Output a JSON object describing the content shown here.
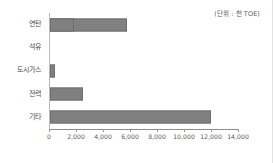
{
  "chart_data": {
    "type": "bar",
    "orientation": "horizontal",
    "title": "",
    "subtitle": "",
    "unit_note": "(단위 : 천 TOE)",
    "categories": [
      "연탄",
      "석유",
      "도시가스",
      "전력",
      "기타"
    ],
    "values": [
      400,
      2440,
      11900,
      5700,
      1780
    ],
    "series": [
      {
        "name": "",
        "values": [
          400,
          2440,
          11900,
          5700,
          1780
        ]
      }
    ],
    "xlabel": "",
    "ylabel": "",
    "xlim": [
      0,
      14000
    ],
    "xticks": [
      0,
      2000,
      4000,
      6000,
      8000,
      10000,
      12000,
      14000
    ],
    "xtick_labels": [
      "0",
      "2,000",
      "4,000",
      "6,000",
      "8,000",
      "10,000",
      "12,000",
      "14,000"
    ],
    "grid": false,
    "legend": false,
    "bar_color": "#808080",
    "bar_border_color": "#6f6f6f",
    "axis_color": "#8d8d8d",
    "text_color": "#4a4a4a",
    "background": "#ffffff"
  }
}
